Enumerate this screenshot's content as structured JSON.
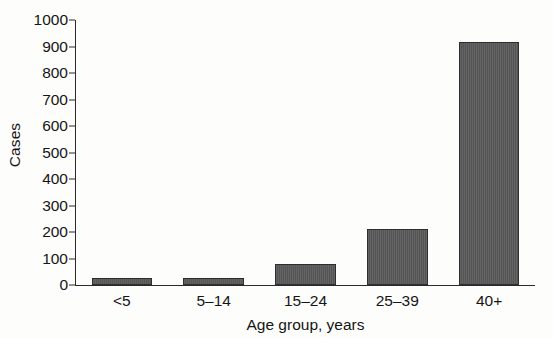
{
  "chart_data": {
    "type": "bar",
    "title": "",
    "subtitle": "",
    "xlabel": "Age group, years",
    "ylabel": "Cases",
    "categories": [
      "<5",
      "5–14",
      "15–24",
      "25–39",
      "40+"
    ],
    "values": [
      27,
      27,
      78,
      210,
      917
    ],
    "series": [
      {
        "name": "Cases",
        "values": [
          27,
          27,
          78,
          210,
          917
        ]
      }
    ],
    "ylim": [
      0,
      1000
    ],
    "y_ticks": [
      0,
      100,
      200,
      300,
      400,
      500,
      600,
      700,
      800,
      900,
      1000
    ],
    "y_tick_labels": [
      "0",
      "100",
      "200",
      "300",
      "400",
      "500",
      "600",
      "700",
      "800",
      "900",
      "1000"
    ],
    "grid": false,
    "legend": null,
    "legend_position": "none",
    "bar_color": "#585858",
    "bar_edge_color": "#2e2e2e",
    "axis_color": "#2b2b2b",
    "background_color": "#fdfdfc",
    "annotations": []
  },
  "artifacts": {
    "ghost_text_left": "",
    "ghost_text_right": ""
  }
}
